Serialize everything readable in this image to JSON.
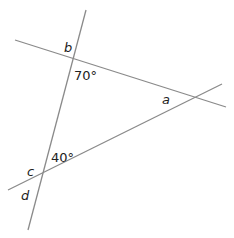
{
  "diagram": {
    "line_color": "#8a8a8a",
    "labels": {
      "b": "b",
      "angle_top": "70°",
      "a": "a",
      "angle_bottom": "40°",
      "c": "c",
      "d": "d"
    }
  }
}
